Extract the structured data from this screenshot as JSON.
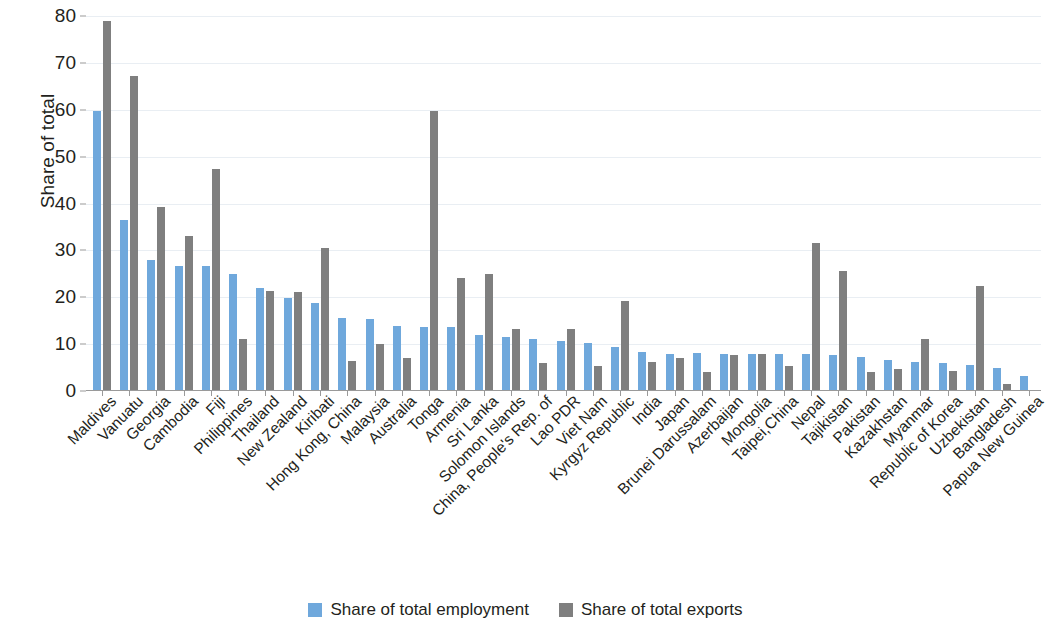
{
  "chart_data": {
    "type": "bar",
    "title": "",
    "xlabel": "",
    "ylabel": "Share of total",
    "ylim": [
      0,
      80
    ],
    "yticks": [
      0,
      10,
      20,
      30,
      40,
      50,
      60,
      70,
      80
    ],
    "grid": true,
    "legend_position": "bottom",
    "colors": {
      "employment": "#6fa8dc",
      "exports": "#7f7f7f"
    },
    "categories": [
      "Maldives",
      "Vanuatu",
      "Georgia",
      "Cambodia",
      "Fiji",
      "Philippines",
      "Thailand",
      "New Zealand",
      "Kiribati",
      "Hong Kong, China",
      "Malaysia",
      "Australia",
      "Tonga",
      "Armenia",
      "Sri Lanka",
      "Solomon Islands",
      "China, People's Rep. of",
      "Lao PDR",
      "Viet Nam",
      "Kyrgyz Republic",
      "India",
      "Japan",
      "Brunei Darussalam",
      "Azerbaijan",
      "Mongolia",
      "Taipei,China",
      "Nepal",
      "Tajikistan",
      "Pakistan",
      "Kazakhstan",
      "Myanmar",
      "Republic of Korea",
      "Uzbekistan",
      "Bangladesh",
      "Papua New Guinea"
    ],
    "series": [
      {
        "name": "Share of total employment",
        "color": "#6fa8dc",
        "values": [
          59.8,
          36.4,
          28.0,
          26.6,
          26.6,
          24.9,
          21.9,
          19.8,
          18.8,
          15.5,
          15.4,
          13.8,
          13.7,
          13.7,
          11.9,
          11.6,
          11.2,
          10.7,
          10.2,
          9.3,
          8.3,
          8.0,
          8.2,
          7.9,
          8.0,
          8.0,
          7.8,
          7.6,
          7.3,
          6.7,
          6.2,
          6.0,
          5.6,
          5.0,
          3.3
        ]
      },
      {
        "name": "Share of total exports",
        "color": "#7f7f7f",
        "values": [
          79.0,
          67.1,
          39.3,
          33.1,
          47.3,
          11.1,
          21.3,
          21.2,
          30.6,
          6.4,
          10.0,
          7.1,
          59.8,
          24.1,
          25.0,
          13.3,
          6.0,
          13.3,
          5.3,
          19.2,
          6.1,
          7.1,
          4.1,
          7.6,
          8.0,
          5.3,
          31.6,
          25.6,
          4.1,
          4.6,
          11.0,
          4.2,
          22.3,
          1.6,
          0
        ]
      }
    ]
  },
  "legend": {
    "items": [
      {
        "label": "Share of total employment",
        "color": "#6fa8dc"
      },
      {
        "label": "Share of total exports",
        "color": "#7f7f7f"
      }
    ]
  }
}
